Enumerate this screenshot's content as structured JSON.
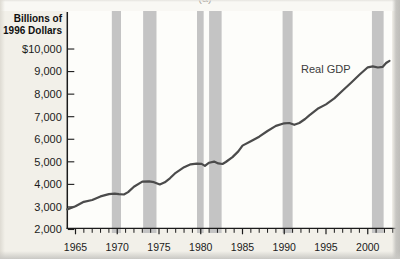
{
  "figure": {
    "partial_top_label": "(a)",
    "y_axis_title_line1": "Billions of",
    "y_axis_title_line2": "1996 Dollars",
    "series_label": "Real GDP"
  },
  "chart_data": {
    "type": "line",
    "title": "",
    "xlabel": "",
    "ylabel": "Billions of 1996 Dollars",
    "legend_position": "inline-annotation",
    "grid": false,
    "series": [
      {
        "name": "Real GDP",
        "x": [
          1964,
          1965,
          1966,
          1967,
          1968,
          1969,
          1969.7,
          1970.2,
          1970.8,
          1971.3,
          1972,
          1973,
          1973.8,
          1974.4,
          1975.1,
          1975.7,
          1976.3,
          1977,
          1978,
          1978.8,
          1979.5,
          1980.1,
          1980.5,
          1981,
          1981.6,
          1982.1,
          1982.6,
          1983,
          1983.8,
          1984.5,
          1985,
          1986,
          1987,
          1988,
          1989,
          1990,
          1990.6,
          1991.2,
          1991.8,
          1992.5,
          1993,
          1994,
          1995,
          1996,
          1997,
          1998,
          1999,
          2000,
          2000.6,
          2001.2,
          2001.8,
          2002.2,
          2002.6
        ],
        "values": [
          2889,
          3028,
          3227,
          3308,
          3466,
          3571,
          3590,
          3565,
          3552,
          3660,
          3898,
          4123,
          4135,
          4095,
          3995,
          4090,
          4270,
          4512,
          4761,
          4890,
          4920,
          4910,
          4820,
          4960,
          5010,
          4930,
          4905,
          4990,
          5210,
          5460,
          5717,
          5912,
          6113,
          6368,
          6592,
          6708,
          6720,
          6640,
          6720,
          6900,
          7063,
          7348,
          7544,
          7813,
          8160,
          8509,
          8859,
          9191,
          9230,
          9180,
          9210,
          9380,
          9480
        ]
      }
    ],
    "x_range": [
      1964,
      2003.5
    ],
    "y_range": [
      2000,
      10000
    ],
    "x_tick_label_years": [
      1965,
      1970,
      1975,
      1980,
      1985,
      1990,
      1995,
      2000
    ],
    "x_minor_tick_first_year": 1965,
    "x_minor_tick_last_year": 2003,
    "x_minor_ticks_every": 1,
    "y_tick_labels": [
      "$10,000",
      "9,000",
      "8,000",
      "7,000",
      "6,000",
      "5,000",
      "4,000",
      "3,000",
      "2,000"
    ],
    "y_tick_values": [
      10000,
      9000,
      8000,
      7000,
      6000,
      5000,
      4000,
      3000,
      2000
    ],
    "recession_bands_years": [
      [
        1969.35,
        1970.45
      ],
      [
        1973.1,
        1974.7
      ],
      [
        1979.55,
        1980.35
      ],
      [
        1981.0,
        1982.5
      ],
      [
        1989.8,
        1991.0
      ],
      [
        2000.5,
        2001.9
      ]
    ],
    "colors": {
      "line": "#4b4b4b",
      "recession_band": "#c4c4c4",
      "axis": "#1b1b1b",
      "tick_text": "#1b1b1b",
      "plot_background": "#fdfdfa",
      "page_background": "#f2f0e9"
    }
  }
}
